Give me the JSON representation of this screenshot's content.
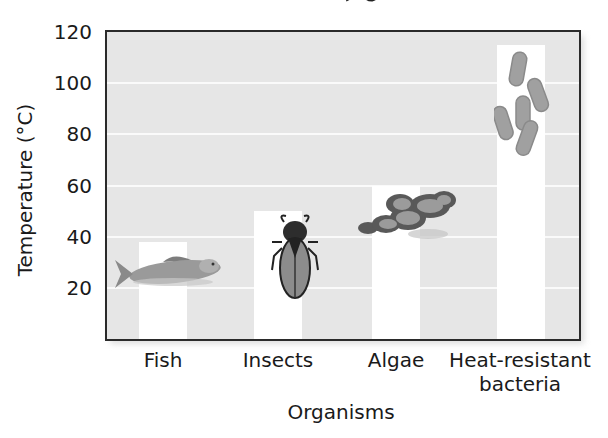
{
  "chart_data": {
    "type": "bar",
    "title": "",
    "xlabel": "Organisms",
    "ylabel": "Temperature (°C)",
    "categories": [
      "Fish",
      "Insects",
      "Algae",
      "Heat-resistant bacteria"
    ],
    "values": [
      38,
      50,
      60,
      115
    ],
    "ylim": [
      0,
      120
    ],
    "yticks": [
      20,
      40,
      60,
      80,
      100,
      120
    ],
    "grid": true,
    "legend": null,
    "bar_color": "#ffffff",
    "plot_background": "#e6e6e6",
    "annotations": [
      "fish illustration",
      "insect illustration",
      "algae illustration",
      "bacteria illustration"
    ]
  },
  "axis": {
    "y_ticks": [
      "20",
      "40",
      "60",
      "80",
      "100",
      "120"
    ],
    "y_label": "Temperature (°C)",
    "x_label": "Organisms",
    "x_ticks": [
      {
        "line1": "Fish",
        "line2": ""
      },
      {
        "line1": "Insects",
        "line2": ""
      },
      {
        "line1": "Algae",
        "line2": ""
      },
      {
        "line1": "Heat-resistant",
        "line2": "bacteria"
      }
    ]
  },
  "icons": [
    "fish-icon",
    "insect-icon",
    "algae-icon",
    "bacteria-icon"
  ]
}
